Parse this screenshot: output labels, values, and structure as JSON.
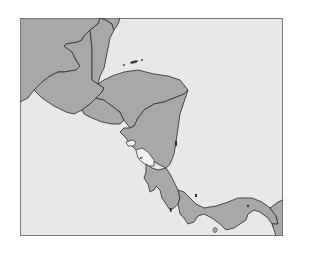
{
  "map": {
    "region": "Central America",
    "colors": {
      "sea": "#e8e8e8",
      "land": "#a8a8a8",
      "border": "#3a3a3a",
      "frame": "#7a7a7a",
      "lake": "#f2f2f2"
    },
    "countries": [
      {
        "id": "mexico",
        "name": "Mexico"
      },
      {
        "id": "guatemala",
        "name": "Guatemala"
      },
      {
        "id": "belize",
        "name": "Belize"
      },
      {
        "id": "el-salvador",
        "name": "El Salvador"
      },
      {
        "id": "honduras",
        "name": "Honduras"
      },
      {
        "id": "nicaragua",
        "name": "Nicaragua"
      },
      {
        "id": "costa-rica",
        "name": "Costa Rica"
      },
      {
        "id": "panama",
        "name": "Panama"
      },
      {
        "id": "colombia",
        "name": "Colombia"
      }
    ],
    "lakes": [
      {
        "id": "lake-nicaragua",
        "name": "Lake Nicaragua"
      },
      {
        "id": "lake-managua",
        "name": "Lake Managua"
      }
    ]
  }
}
